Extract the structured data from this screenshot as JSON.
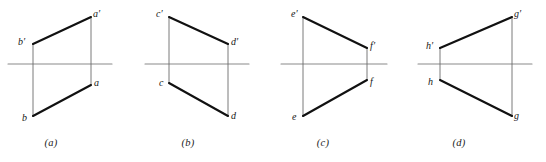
{
  "figure": {
    "width": 546,
    "height": 162,
    "background_color": "#ffffff",
    "line_color": "#111111",
    "axis_color": "#8a8a8a",
    "thin_line_color": "#6b6b6b",
    "label_color": "#161616"
  },
  "panels": [
    {
      "id": "a",
      "caption": "(a)",
      "caption_x": 51,
      "caption_y": 137,
      "axis": {
        "x1": 8,
        "y1": 64,
        "x2": 112,
        "y2": 64
      },
      "projector_left": {
        "x1": 33,
        "y1": 44,
        "x2": 33,
        "y2": 116
      },
      "projector_right": {
        "x1": 91,
        "y1": 17,
        "x2": 91,
        "y2": 85
      },
      "top_segment": {
        "x1": 33,
        "y1": 44,
        "x2": 91,
        "y2": 17
      },
      "bottom_segment": {
        "x1": 33,
        "y1": 116,
        "x2": 91,
        "y2": 85
      },
      "vertices": [
        {
          "name": "a-prime",
          "label": "a′",
          "x": 93,
          "y": 8
        },
        {
          "name": "b-prime",
          "label": "b′",
          "x": 18,
          "y": 36
        },
        {
          "name": "a",
          "label": "a",
          "x": 94,
          "y": 77
        },
        {
          "name": "b",
          "label": "b",
          "x": 22,
          "y": 112
        }
      ]
    },
    {
      "id": "b",
      "caption": "(b)",
      "caption_x": 188,
      "caption_y": 137,
      "axis": {
        "x1": 145,
        "y1": 64,
        "x2": 249,
        "y2": 64
      },
      "projector_left": {
        "x1": 169,
        "y1": 17,
        "x2": 169,
        "y2": 83
      },
      "projector_right": {
        "x1": 228,
        "y1": 44,
        "x2": 228,
        "y2": 116
      },
      "top_segment": {
        "x1": 169,
        "y1": 17,
        "x2": 228,
        "y2": 44
      },
      "bottom_segment": {
        "x1": 169,
        "y1": 83,
        "x2": 228,
        "y2": 116
      },
      "vertices": [
        {
          "name": "c-prime",
          "label": "c′",
          "x": 156,
          "y": 8
        },
        {
          "name": "d-prime",
          "label": "d′",
          "x": 231,
          "y": 36
        },
        {
          "name": "c",
          "label": "c",
          "x": 159,
          "y": 77
        },
        {
          "name": "d",
          "label": "d",
          "x": 231,
          "y": 110
        }
      ]
    },
    {
      "id": "c",
      "caption": "(c)",
      "caption_x": 323,
      "caption_y": 137,
      "axis": {
        "x1": 281,
        "y1": 64,
        "x2": 387,
        "y2": 64
      },
      "projector_left": {
        "x1": 303,
        "y1": 17,
        "x2": 303,
        "y2": 116
      },
      "projector_right": {
        "x1": 367,
        "y1": 48,
        "x2": 367,
        "y2": 80
      },
      "top_segment": {
        "x1": 303,
        "y1": 17,
        "x2": 367,
        "y2": 48
      },
      "bottom_segment": {
        "x1": 303,
        "y1": 116,
        "x2": 367,
        "y2": 80
      },
      "vertices": [
        {
          "name": "e-prime",
          "label": "e′",
          "x": 291,
          "y": 8
        },
        {
          "name": "f-prime",
          "label": "f′",
          "x": 370,
          "y": 40
        },
        {
          "name": "f",
          "label": "f",
          "x": 370,
          "y": 76
        },
        {
          "name": "e",
          "label": "e",
          "x": 292,
          "y": 111
        }
      ]
    },
    {
      "id": "d",
      "caption": "(d)",
      "caption_x": 459,
      "caption_y": 137,
      "axis": {
        "x1": 418,
        "y1": 64,
        "x2": 532,
        "y2": 64
      },
      "projector_left": {
        "x1": 440,
        "y1": 48,
        "x2": 440,
        "y2": 80
      },
      "projector_right": {
        "x1": 512,
        "y1": 17,
        "x2": 512,
        "y2": 116
      },
      "top_segment": {
        "x1": 440,
        "y1": 48,
        "x2": 512,
        "y2": 17
      },
      "bottom_segment": {
        "x1": 440,
        "y1": 80,
        "x2": 512,
        "y2": 116
      },
      "vertices": [
        {
          "name": "g-prime",
          "label": "g′",
          "x": 514,
          "y": 8
        },
        {
          "name": "h-prime",
          "label": "h′",
          "x": 426,
          "y": 40
        },
        {
          "name": "h",
          "label": "h",
          "x": 428,
          "y": 76
        },
        {
          "name": "g",
          "label": "g",
          "x": 514,
          "y": 110
        }
      ]
    }
  ]
}
